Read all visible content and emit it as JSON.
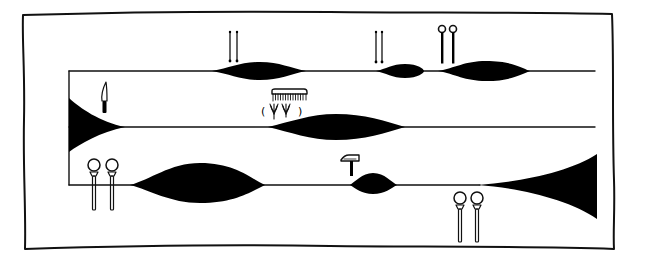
{
  "figure": {
    "title": "Graphic score with three staves of swelling sound shapes and instrument/tool symbols",
    "background_color": "#ffffff",
    "ink_color": "#000000"
  },
  "staves": [
    {
      "id": "top",
      "events": [
        {
          "type": "swell",
          "symbol": "knitting-needles",
          "symbol_label": "needles"
        },
        {
          "type": "swell",
          "symbol": "knitting-needles",
          "symbol_label": "needles"
        },
        {
          "type": "swell",
          "symbol": "ring-pins",
          "symbol_label": "pins"
        }
      ]
    },
    {
      "id": "middle",
      "events": [
        {
          "type": "decrescendo-wedge",
          "symbol": "knife",
          "symbol_label": "knife"
        },
        {
          "type": "swell",
          "symbol": "comb-and-grass",
          "symbol_label": "comb",
          "annotation": "( ψ ψ )"
        }
      ]
    },
    {
      "id": "bottom",
      "events": [
        {
          "type": "swell",
          "symbol": "mallets",
          "symbol_label": "mallets"
        },
        {
          "type": "swell",
          "symbol": "hammer",
          "symbol_label": "hammer"
        },
        {
          "type": "crescendo-wedge",
          "symbol": "mallets",
          "symbol_label": "mallets"
        }
      ]
    }
  ],
  "annotations": {
    "grass_parenthetical": "( ψ ψ )",
    "open_paren": "(",
    "close_paren": ")"
  }
}
